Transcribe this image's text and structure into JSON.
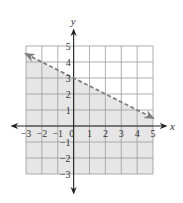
{
  "chart_data": {
    "type": "line",
    "title": "",
    "xlabel": "x",
    "ylabel": "y",
    "xlim": [
      -3,
      5
    ],
    "ylim": [
      -3,
      5
    ],
    "grid": true,
    "x_ticks": [
      "-3",
      "-2",
      "-1",
      "0",
      "1",
      "2",
      "3",
      "4",
      "5"
    ],
    "y_ticks": [
      "5",
      "4",
      "3",
      "2",
      "1",
      "-1",
      "-2",
      "-3"
    ],
    "boundary_line": {
      "style": "dashed",
      "slope": -0.5,
      "intercept": 3,
      "points": [
        [
          -3,
          4.5
        ],
        [
          5,
          0.5
        ]
      ],
      "arrows": "both"
    },
    "shaded_region": "below boundary line",
    "inequality": "y < -1/2 x + 3",
    "colors": {
      "shade": "#e6e6e6",
      "grid": "#9a9a9a",
      "line": "#808080",
      "axis": "#222222"
    }
  }
}
